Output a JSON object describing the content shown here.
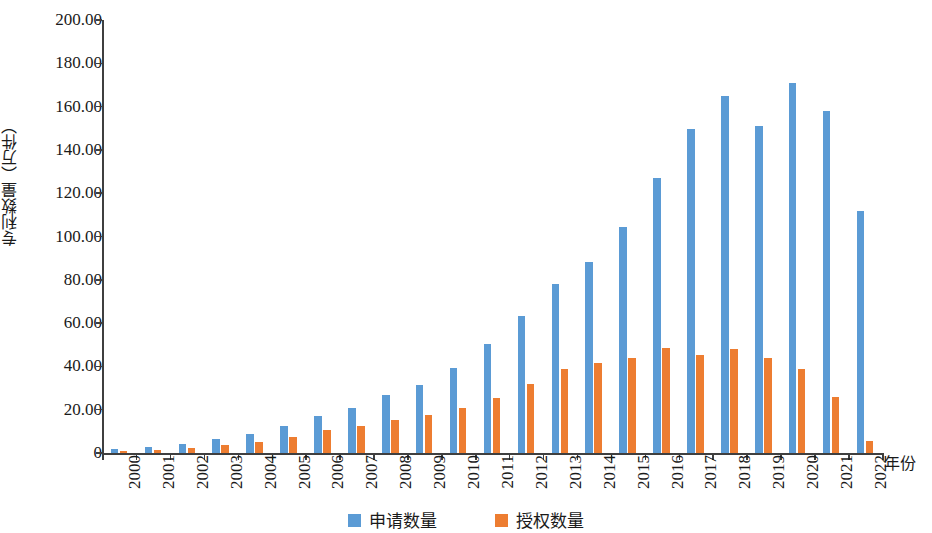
{
  "chart_data": {
    "type": "bar",
    "title": "",
    "subtitle": "",
    "xlabel": "年份",
    "ylabel": "专利数量（万件）",
    "categories": [
      "2000",
      "2001",
      "2002",
      "2003",
      "2004",
      "2005",
      "2006",
      "2007",
      "2008",
      "2009",
      "2010",
      "2011",
      "2012",
      "2013",
      "2014",
      "2015",
      "2016",
      "2017",
      "2018",
      "2019",
      "2020",
      "2021",
      "2022"
    ],
    "series": [
      {
        "name": "申请数量",
        "color": "#5b9bd5",
        "values": [
          2.0,
          3.0,
          4.2,
          6.3,
          8.9,
          12.4,
          17.0,
          20.6,
          26.8,
          31.5,
          39.1,
          50.2,
          63.3,
          78.2,
          88.3,
          104.5,
          127.0,
          149.6,
          164.8,
          151.2,
          171.0,
          158.0,
          111.6
        ]
      },
      {
        "name": "授权数量",
        "color": "#ed7d31",
        "values": [
          0.9,
          1.4,
          2.1,
          3.7,
          5.2,
          7.6,
          10.5,
          12.4,
          15.3,
          17.7,
          20.9,
          25.5,
          31.7,
          38.9,
          41.8,
          43.7,
          48.6,
          45.3,
          48.0,
          44.1,
          39.0,
          26.1,
          5.5
        ]
      }
    ],
    "ylim": [
      0,
      200
    ],
    "yticks": [
      "0",
      "20.00",
      "40.00",
      "60.00",
      "80.00",
      "100.00",
      "120.00",
      "140.00",
      "160.00",
      "180.00",
      "200.00"
    ],
    "ytick_values": [
      0,
      20,
      40,
      60,
      80,
      100,
      120,
      140,
      160,
      180,
      200
    ],
    "grid": false,
    "legend_position": "bottom"
  },
  "legend": {
    "items": [
      {
        "label": "申请数量",
        "color": "#5b9bd5"
      },
      {
        "label": "授权数量",
        "color": "#ed7d31"
      }
    ]
  },
  "axes": {
    "y_title": "专利数量（万件）",
    "x_title": "年份"
  }
}
